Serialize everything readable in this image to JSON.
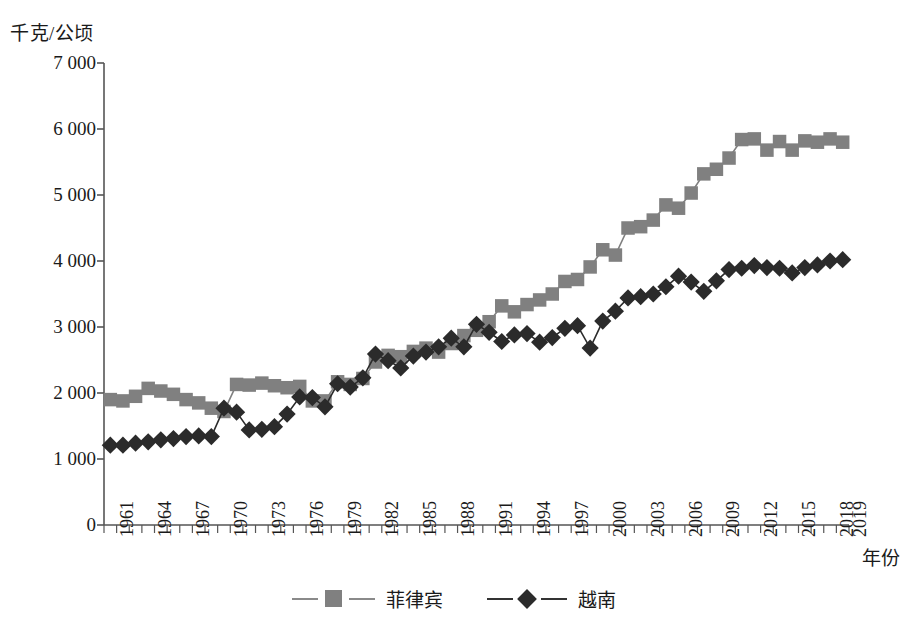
{
  "chart_data": {
    "type": "line",
    "title": "",
    "subtitle": "",
    "xlabel": "年份",
    "ylabel": "千克/公顷",
    "ylim": [
      0,
      7000
    ],
    "ytick_step": 1000,
    "ytick_labels": [
      "7 000",
      "6 000",
      "5 000",
      "4 000",
      "3 000",
      "2 000",
      "1 000",
      "0"
    ],
    "ytick_values": [
      7000,
      6000,
      5000,
      4000,
      3000,
      2000,
      1000,
      0
    ],
    "grid": false,
    "legend_position": "bottom-center",
    "x": [
      1961,
      1962,
      1963,
      1964,
      1965,
      1966,
      1967,
      1968,
      1969,
      1970,
      1971,
      1972,
      1973,
      1974,
      1975,
      1976,
      1977,
      1978,
      1979,
      1980,
      1981,
      1982,
      1983,
      1984,
      1985,
      1986,
      1987,
      1988,
      1989,
      1990,
      1991,
      1992,
      1993,
      1994,
      1995,
      1996,
      1997,
      1998,
      1999,
      2000,
      2001,
      2002,
      2003,
      2004,
      2005,
      2006,
      2007,
      2008,
      2009,
      2010,
      2011,
      2012,
      2013,
      2014,
      2015,
      2016,
      2017,
      2018,
      2019
    ],
    "xtick_labels": [
      "1961",
      "1964",
      "1967",
      "1970",
      "1973",
      "1976",
      "1979",
      "1982",
      "1985",
      "1988",
      "1991",
      "1994",
      "1997",
      "2000",
      "2003",
      "2006",
      "2009",
      "2012",
      "2015",
      "2018",
      "2019"
    ],
    "series": [
      {
        "name": "菲律宾",
        "color": "#808080",
        "marker": "square",
        "values": [
          1900,
          1880,
          1950,
          2070,
          2030,
          1980,
          1900,
          1850,
          1770,
          1720,
          2130,
          2120,
          2150,
          2110,
          2080,
          2100,
          1880,
          1880,
          2170,
          2130,
          2220,
          2470,
          2570,
          2550,
          2630,
          2680,
          2620,
          2750,
          2870,
          2950,
          3080,
          3320,
          3230,
          3340,
          3410,
          3500,
          3690,
          3720,
          3910,
          4170,
          4090,
          4500,
          4520,
          4620,
          4850,
          4800,
          5030,
          5320,
          5390,
          5560,
          5840,
          5850,
          5680,
          5810,
          5680,
          5820,
          5800,
          5850,
          5800
        ]
      },
      {
        "name": "越南",
        "color": "#2b2b2b",
        "marker": "diamond",
        "values": [
          1210,
          1210,
          1240,
          1260,
          1290,
          1310,
          1340,
          1350,
          1340,
          1770,
          1710,
          1440,
          1450,
          1490,
          1680,
          1940,
          1930,
          1790,
          2140,
          2090,
          2230,
          2590,
          2490,
          2380,
          2560,
          2620,
          2700,
          2830,
          2700,
          3040,
          2920,
          2780,
          2880,
          2900,
          2770,
          2840,
          2980,
          3020,
          2680,
          3090,
          3240,
          3440,
          3460,
          3500,
          3610,
          3770,
          3680,
          3540,
          3700,
          3870,
          3890,
          3930,
          3900,
          3890,
          3820,
          3900,
          3940,
          4000,
          4020
        ]
      }
    ]
  },
  "legend": {
    "entries": [
      {
        "label": "菲律宾"
      },
      {
        "label": "越南"
      }
    ]
  },
  "axes": {
    "y_title": "千克/公顷",
    "x_title": "年份"
  }
}
